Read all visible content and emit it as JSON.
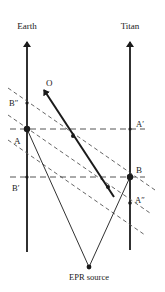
{
  "diagram": {
    "axes": {
      "earth": {
        "label": "Earth",
        "x": 27,
        "y_top": 40,
        "y_bottom": 250
      },
      "titan": {
        "label": "Titan",
        "x": 130,
        "y_top": 40,
        "y_bottom": 250
      }
    },
    "points": {
      "A": {
        "label": "A",
        "x": 27,
        "y": 129
      },
      "B_double_prime": {
        "label": "B″",
        "x": 27,
        "y": 103
      },
      "B_prime": {
        "label": "B′",
        "x": 27,
        "y": 177
      },
      "B": {
        "label": "B",
        "x": 130,
        "y": 177
      },
      "A_prime": {
        "label": "A′",
        "x": 130,
        "y": 129
      },
      "A_double_prime": {
        "label": "A″",
        "x": 130,
        "y": 203
      },
      "epr_source": {
        "label": "EPR source",
        "x": 89,
        "y": 267
      }
    },
    "observer": {
      "label": "O",
      "from": [
        114,
        197
      ],
      "to": [
        43,
        88
      ],
      "dots": [
        [
          73,
          136
        ],
        [
          108,
          187
        ]
      ]
    },
    "colors": {
      "line": "#1a1a1a",
      "dashed": "#555555"
    }
  }
}
